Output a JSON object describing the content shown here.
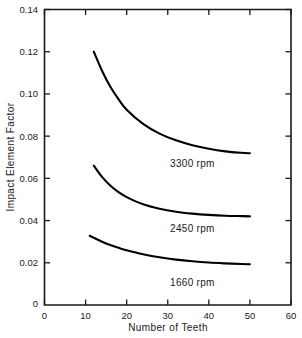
{
  "chart_data": {
    "type": "line",
    "title": "",
    "xlabel": "Number of Teeth",
    "ylabel": "Impact Element Factor",
    "xlim": [
      0,
      60
    ],
    "ylim": [
      0,
      0.14
    ],
    "xticks": [
      "0",
      "10",
      "20",
      "30",
      "40",
      "50",
      "60"
    ],
    "xtick_values": [
      0,
      10,
      20,
      30,
      40,
      50,
      60
    ],
    "yticks": [
      "0",
      "0.02",
      "0.04",
      "0.06",
      "0.08",
      "0.10",
      "0.12",
      "0.14"
    ],
    "ytick_values": [
      0,
      0.02,
      0.04,
      0.06,
      0.08,
      0.1,
      0.12,
      0.14
    ],
    "grid": false,
    "legend_position": "inline-annotation",
    "series": [
      {
        "name": "3300 rpm",
        "label": "3300 rpm",
        "label_x": 36,
        "label_y": 0.0655,
        "x": [
          12,
          14,
          16,
          18,
          20,
          24,
          28,
          32,
          36,
          40,
          44,
          48,
          50
        ],
        "values": [
          0.12,
          0.111,
          0.1035,
          0.0975,
          0.0925,
          0.0858,
          0.0812,
          0.078,
          0.0757,
          0.074,
          0.0728,
          0.0721,
          0.0719
        ]
      },
      {
        "name": "2450 rpm",
        "label": "2450 rpm",
        "label_x": 36,
        "label_y": 0.0345,
        "x": [
          12,
          14,
          16,
          18,
          20,
          24,
          28,
          32,
          36,
          40,
          44,
          48,
          50
        ],
        "values": [
          0.066,
          0.0607,
          0.0566,
          0.0535,
          0.0511,
          0.0477,
          0.0456,
          0.0442,
          0.0433,
          0.0427,
          0.0423,
          0.0421,
          0.042
        ]
      },
      {
        "name": "1660 rpm",
        "label": "1660 rpm",
        "label_x": 36,
        "label_y": 0.009,
        "x": [
          11,
          14,
          16,
          18,
          20,
          24,
          28,
          32,
          36,
          40,
          44,
          48,
          50
        ],
        "values": [
          0.0328,
          0.03,
          0.0284,
          0.0271,
          0.0259,
          0.024,
          0.0226,
          0.0215,
          0.0207,
          0.0201,
          0.0197,
          0.0194,
          0.0193
        ]
      }
    ]
  },
  "axes": {
    "x_axis_label": "Number of Teeth",
    "y_axis_label": "Impact Element Factor"
  },
  "colors": {
    "curve": "#000000",
    "axis": "#1a1a1a",
    "background": "#ffffff"
  }
}
